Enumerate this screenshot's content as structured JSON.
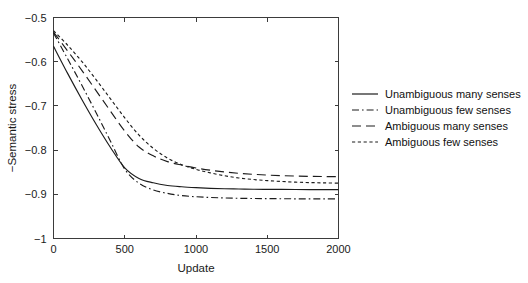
{
  "chart_data": {
    "type": "line",
    "title": "",
    "xlabel": "Update",
    "ylabel": "−Semantic stress",
    "xlim": [
      0,
      2000
    ],
    "ylim": [
      -1,
      -0.5
    ],
    "xticks": [
      0,
      500,
      1000,
      1500,
      2000
    ],
    "xtick_labels": [
      "0",
      "500",
      "1000",
      "1500",
      "2000"
    ],
    "yticks": [
      -1,
      -0.9,
      -0.8,
      -0.7,
      -0.6,
      -0.5
    ],
    "ytick_labels": [
      "−1",
      "−0.9",
      "−0.8",
      "−0.7",
      "−0.6",
      "−0.5"
    ],
    "grid": false,
    "legend_position": "right-outside",
    "x": [
      0,
      100,
      200,
      300,
      400,
      500,
      600,
      700,
      800,
      900,
      1000,
      1100,
      1200,
      1300,
      1400,
      1500,
      1600,
      1700,
      1800,
      1900,
      2000
    ],
    "series": [
      {
        "name": "Unambiguous many senses",
        "linestyle": "solid",
        "color": "#1c1c1c",
        "values": [
          -0.565,
          -0.627,
          -0.686,
          -0.742,
          -0.794,
          -0.84,
          -0.864,
          -0.874,
          -0.88,
          -0.883,
          -0.885,
          -0.8865,
          -0.8875,
          -0.888,
          -0.8885,
          -0.8888,
          -0.889,
          -0.8892,
          -0.8893,
          -0.8894,
          -0.8895
        ]
      },
      {
        "name": "Unambiguous few senses",
        "linestyle": "dashdot",
        "color": "#1c1c1c",
        "values": [
          -0.535,
          -0.594,
          -0.654,
          -0.716,
          -0.78,
          -0.843,
          -0.875,
          -0.89,
          -0.898,
          -0.903,
          -0.9055,
          -0.9072,
          -0.9083,
          -0.909,
          -0.9095,
          -0.9098,
          -0.91,
          -0.9102,
          -0.9103,
          -0.9104,
          -0.9105
        ]
      },
      {
        "name": "Ambiguous many senses",
        "linestyle": "longdash",
        "color": "#1c1c1c",
        "values": [
          -0.533,
          -0.576,
          -0.62,
          -0.666,
          -0.712,
          -0.757,
          -0.793,
          -0.813,
          -0.826,
          -0.834,
          -0.8405,
          -0.8455,
          -0.8495,
          -0.8525,
          -0.8548,
          -0.8565,
          -0.8578,
          -0.8588,
          -0.8594,
          -0.8598,
          -0.86
        ]
      },
      {
        "name": "Ambiguous few senses",
        "linestyle": "dotted",
        "color": "#1c1c1c",
        "values": [
          -0.53,
          -0.563,
          -0.6,
          -0.641,
          -0.684,
          -0.727,
          -0.766,
          -0.796,
          -0.818,
          -0.833,
          -0.8435,
          -0.8515,
          -0.858,
          -0.863,
          -0.8665,
          -0.869,
          -0.871,
          -0.8725,
          -0.8735,
          -0.8742,
          -0.8748
        ]
      }
    ]
  },
  "legend": {
    "items": [
      {
        "label": "Unambiguous many senses"
      },
      {
        "label": "Unambiguous few senses"
      },
      {
        "label": "Ambiguous many senses"
      },
      {
        "label": "Ambiguous few senses"
      }
    ]
  }
}
